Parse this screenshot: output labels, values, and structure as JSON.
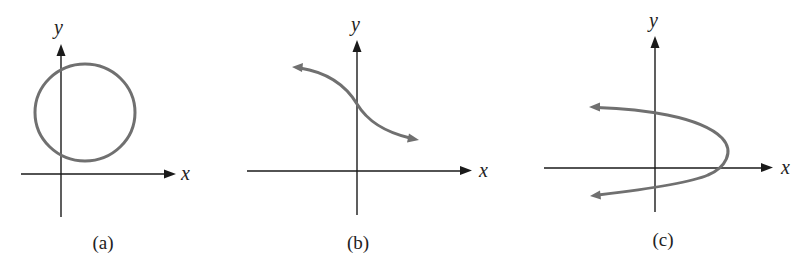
{
  "figure": {
    "colors": {
      "axis": "#1a1a1a",
      "curve": "#707070",
      "text": "#222222",
      "background": "#ffffff"
    },
    "panels": [
      {
        "id": "a",
        "label": "(a)",
        "x_axis_label": "x",
        "y_axis_label": "y",
        "curve": "circle",
        "description": "Closed circle centered in the first quadrant, crossing the y-axis twice"
      },
      {
        "id": "b",
        "label": "(b)",
        "x_axis_label": "x",
        "y_axis_label": "y",
        "curve": "decreasing-s-curve",
        "description": "Decreasing curve with arrows at both ends crossing the y-axis once"
      },
      {
        "id": "c",
        "label": "(c)",
        "x_axis_label": "x",
        "y_axis_label": "y",
        "curve": "sideways-parabola",
        "description": "Parabola opening to the left with arrows on both ends, crossing the y-axis twice"
      }
    ]
  }
}
